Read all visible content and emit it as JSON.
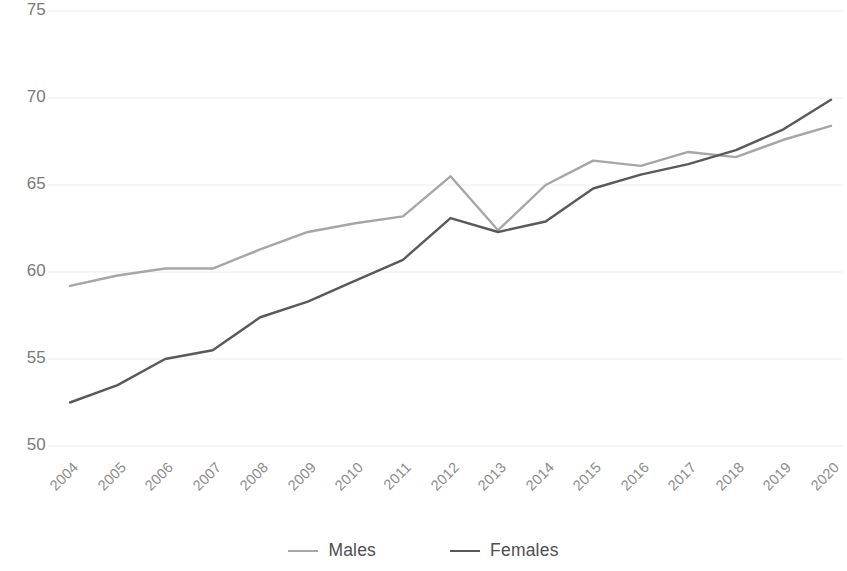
{
  "chart_data": {
    "type": "line",
    "title": "",
    "subtitle": "",
    "xlabel": "",
    "ylabel": "",
    "categories": [
      "2004",
      "2005",
      "2006",
      "2007",
      "2008",
      "2009",
      "2010",
      "2011",
      "2012",
      "2013",
      "2014",
      "2015",
      "2016",
      "2017",
      "2018",
      "2019",
      "2020"
    ],
    "ylim": [
      50,
      75
    ],
    "yticks": [
      50,
      55,
      60,
      65,
      70,
      75
    ],
    "grid": true,
    "grid_axis": "y",
    "legend_position": "bottom",
    "series": [
      {
        "name": "Males",
        "color": "#a6a6a6",
        "values": [
          59.2,
          59.8,
          60.2,
          60.2,
          61.3,
          62.3,
          62.8,
          63.2,
          65.5,
          62.4,
          65.0,
          66.4,
          66.1,
          66.9,
          66.6,
          67.6,
          68.4
        ]
      },
      {
        "name": "Females",
        "color": "#595959",
        "values": [
          52.5,
          53.5,
          55.0,
          55.5,
          57.4,
          58.3,
          59.5,
          60.7,
          63.1,
          62.3,
          62.9,
          64.8,
          65.6,
          66.2,
          67.0,
          68.2,
          69.9
        ]
      }
    ]
  },
  "legend": {
    "items": [
      {
        "label": "Males",
        "color": "#a6a6a6"
      },
      {
        "label": "Females",
        "color": "#595959"
      }
    ]
  },
  "axis": {
    "y_tick_labels": [
      "75",
      "70",
      "65",
      "60",
      "55",
      "50"
    ],
    "x_tick_labels": [
      "2004",
      "2005",
      "2006",
      "2007",
      "2008",
      "2009",
      "2010",
      "2011",
      "2012",
      "2013",
      "2014",
      "2015",
      "2016",
      "2017",
      "2018",
      "2019",
      "2020"
    ]
  },
  "colors": {
    "males_line": "#a6a6a6",
    "females_line": "#595959",
    "gridline": "#ededed",
    "tick_text": "#8c8c8c"
  }
}
